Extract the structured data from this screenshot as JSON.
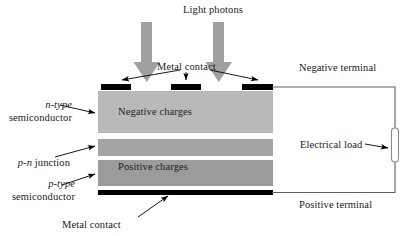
{
  "figure": {
    "type": "diagram",
    "title": "Light photons"
  },
  "labels": {
    "light_photons": "Light photons",
    "metal_contact_top": "Metal contact",
    "metal_contact_bottom": "Metal contact",
    "negative_terminal": "Negative terminal",
    "positive_terminal": "Positive terminal",
    "electrical_load": "Electrical load",
    "negative_charges": "Negative charges",
    "positive_charges": "Positive charges",
    "n_type_line1": "n-type",
    "n_type_line2": "semiconductor",
    "pn_junction_italic": "p-n",
    "pn_junction_rest": " junction",
    "p_type_line1": "p-type",
    "p_type_line2": "semiconductor"
  },
  "colors": {
    "n_layer": "#b9b9b9",
    "junction_layer": "#a3a3a3",
    "p_layer": "#9a9a9a",
    "photon_arrow": "#a0a0a0",
    "metal_contact": "#000000",
    "wire": "#5a5a5a",
    "leader": "#000000",
    "background": "#ffffff",
    "text": "#1a1a1a"
  },
  "geometry": {
    "block_left": 98,
    "block_right": 273,
    "n_layer": {
      "y": 91,
      "h": 42
    },
    "junction_layer": {
      "y": 139,
      "h": 17
    },
    "p_layer": {
      "y": 160,
      "h": 26
    },
    "bottom_contact": {
      "y": 190,
      "h": 5
    },
    "top_contacts": [
      {
        "x": 101,
        "w": 30
      },
      {
        "x": 171,
        "w": 30
      },
      {
        "x": 242,
        "w": 30
      }
    ],
    "photon_arrows": [
      {
        "cx": 147,
        "top": 22,
        "tip": 81
      },
      {
        "cx": 219,
        "top": 22,
        "tip": 81
      }
    ],
    "load": {
      "cx": 395,
      "cy": 145,
      "w": 7,
      "h": 34
    }
  }
}
